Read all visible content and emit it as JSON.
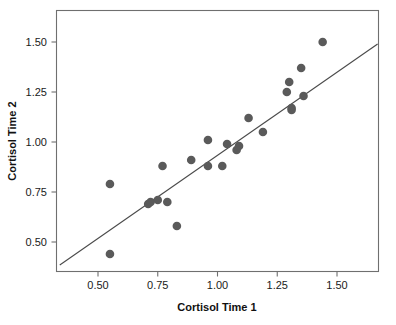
{
  "chart_data": {
    "type": "scatter",
    "title": "",
    "xlabel": "Cortisol Time 1",
    "ylabel": "Cortisol Time 2",
    "xlim": [
      0.33,
      1.67
    ],
    "ylim": [
      0.36,
      1.65
    ],
    "xticks": [
      0.5,
      0.75,
      1.0,
      1.25,
      1.5
    ],
    "xticklabels": [
      "0.50",
      "0.75",
      "1.00",
      "1.25",
      "1.50"
    ],
    "yticks": [
      0.5,
      0.75,
      1.0,
      1.25,
      1.5
    ],
    "yticklabels": [
      "0.50",
      "0.75",
      "1.00",
      "1.25",
      "1.50"
    ],
    "grid": false,
    "legend": null,
    "marker_color": "#5a5a5a",
    "line_color": "#4a4a4a",
    "frame_color": "#6f6f6f",
    "points": [
      {
        "x": 0.55,
        "y": 0.79
      },
      {
        "x": 0.55,
        "y": 0.44
      },
      {
        "x": 0.71,
        "y": 0.69
      },
      {
        "x": 0.72,
        "y": 0.7
      },
      {
        "x": 0.75,
        "y": 0.71
      },
      {
        "x": 0.77,
        "y": 0.88
      },
      {
        "x": 0.79,
        "y": 0.7
      },
      {
        "x": 0.83,
        "y": 0.58
      },
      {
        "x": 0.89,
        "y": 0.91
      },
      {
        "x": 0.96,
        "y": 1.01
      },
      {
        "x": 0.96,
        "y": 0.88
      },
      {
        "x": 1.02,
        "y": 0.88
      },
      {
        "x": 1.04,
        "y": 0.99
      },
      {
        "x": 1.08,
        "y": 0.96
      },
      {
        "x": 1.09,
        "y": 0.98
      },
      {
        "x": 1.13,
        "y": 1.12
      },
      {
        "x": 1.19,
        "y": 1.05
      },
      {
        "x": 1.29,
        "y": 1.25
      },
      {
        "x": 1.3,
        "y": 1.3
      },
      {
        "x": 1.31,
        "y": 1.17
      },
      {
        "x": 1.31,
        "y": 1.16
      },
      {
        "x": 1.35,
        "y": 1.37
      },
      {
        "x": 1.36,
        "y": 1.23
      },
      {
        "x": 1.44,
        "y": 1.5
      }
    ],
    "fit_line": {
      "x1": 0.34,
      "y1": 0.385,
      "x2": 1.67,
      "y2": 1.49
    }
  }
}
